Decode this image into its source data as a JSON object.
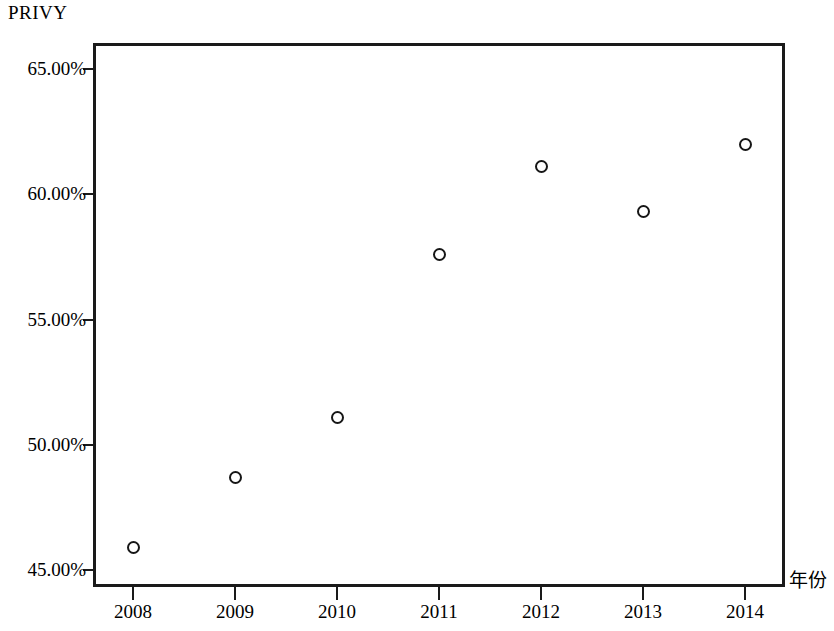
{
  "chart_data": {
    "type": "scatter",
    "title": "PRIVY",
    "xlabel": "年份",
    "ylabel": "PRIVY",
    "x": [
      2008,
      2009,
      2010,
      2011,
      2012,
      2013,
      2014
    ],
    "categories": [
      "2008",
      "2009",
      "2010",
      "2011",
      "2012",
      "2013",
      "2014"
    ],
    "values": [
      45.9,
      48.7,
      51.1,
      57.6,
      61.1,
      59.3,
      62.0
    ],
    "series": [
      {
        "name": "PRIVY",
        "values": [
          45.9,
          48.7,
          51.1,
          57.6,
          61.1,
          59.3,
          62.0
        ]
      }
    ],
    "ylim": [
      44.3,
      65.9
    ],
    "xlim": [
      2007.6,
      2014.4
    ],
    "y_ticks": [
      45,
      50,
      55,
      60,
      65
    ],
    "y_tick_labels": [
      "45.00%",
      "50.00%",
      "55.00%",
      "60.00%",
      "65.00%"
    ],
    "x_ticks": [
      2008,
      2009,
      2010,
      2011,
      2012,
      2013,
      2014
    ],
    "x_tick_labels": [
      "2008",
      "2009",
      "2010",
      "2011",
      "2012",
      "2013",
      "2014"
    ],
    "grid": false,
    "legend": false,
    "marker": "open-circle",
    "marker_color": "#161616",
    "axis_color": "#1a1a1a",
    "background": "#ffffff"
  },
  "axes": {
    "y_labels": [
      "65.00%",
      "60.00%",
      "55.00%",
      "50.00%",
      "45.00%"
    ],
    "x_labels": [
      "2008",
      "2009",
      "2010",
      "2011",
      "2012",
      "2013",
      "2014"
    ],
    "x_axis_name": "年份",
    "y_axis_name": "PRIVY"
  },
  "points": [
    {
      "label": "2008",
      "value": "45.9"
    },
    {
      "label": "2009",
      "value": "48.7"
    },
    {
      "label": "2010",
      "value": "51.1"
    },
    {
      "label": "2011",
      "value": "57.6"
    },
    {
      "label": "2012",
      "value": "61.1"
    },
    {
      "label": "2013",
      "value": "59.3"
    },
    {
      "label": "2014",
      "value": "62.0"
    }
  ]
}
